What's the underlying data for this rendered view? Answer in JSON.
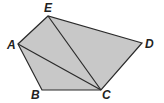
{
  "diagram": {
    "fill_color": "#c8c8c8",
    "stroke_color": "#2a2a2a",
    "vertices": [
      {
        "name": "A",
        "x": 18,
        "y": 44,
        "label_x": 7,
        "label_y": 49
      },
      {
        "name": "B",
        "x": 42,
        "y": 90,
        "label_x": 31,
        "label_y": 99
      },
      {
        "name": "C",
        "x": 101,
        "y": 90,
        "label_x": 102,
        "label_y": 99
      },
      {
        "name": "D",
        "x": 142,
        "y": 43,
        "label_x": 145,
        "label_y": 48
      },
      {
        "name": "E",
        "x": 48,
        "y": 16,
        "label_x": 44,
        "label_y": 12
      }
    ],
    "diagonals": [
      {
        "from": "A",
        "to": "C"
      },
      {
        "from": "E",
        "to": "C"
      }
    ]
  }
}
